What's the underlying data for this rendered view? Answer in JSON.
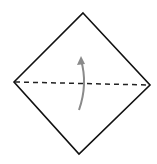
{
  "diagram": {
    "title": "Valley fold in half (bottom corner up to top corner)",
    "shape": "square paper rotated 45° (diamond)",
    "vertices": {
      "top": [
        83,
        13
      ],
      "left": [
        14,
        82
      ],
      "right": [
        150,
        85
      ],
      "bottom": [
        79,
        154
      ]
    },
    "fold_line": {
      "type": "valley-fold",
      "style": "dashed",
      "from": [
        14,
        82
      ],
      "to": [
        150,
        85
      ]
    },
    "arrow": {
      "type": "fold-direction",
      "direction": "up",
      "from": [
        79,
        110
      ],
      "to": [
        81,
        57
      ]
    },
    "colors": {
      "outline": "#111111",
      "fold_line": "#222222",
      "arrow": "#8a8a8a",
      "paper": "#ffffff"
    }
  }
}
